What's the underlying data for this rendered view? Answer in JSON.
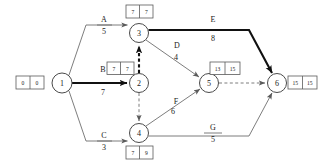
{
  "diagram": {
    "type": "project-network",
    "colors": {
      "background": "#ffffff",
      "edge": "#6e6e6e",
      "critical_path": "#111111",
      "node_stroke": "#4a4a4a",
      "box_stroke": "#5a5a5a",
      "text": "#1a1a1a"
    },
    "nodes": [
      {
        "id": "1",
        "label": "1",
        "cx": 62,
        "cy": 83,
        "r": 10
      },
      {
        "id": "2",
        "label": "2",
        "cx": 139,
        "cy": 83,
        "r": 9.5
      },
      {
        "id": "3",
        "label": "3",
        "cx": 139,
        "cy": 33,
        "r": 9.5
      },
      {
        "id": "4",
        "label": "4",
        "cx": 139,
        "cy": 133,
        "r": 9.5
      },
      {
        "id": "5",
        "label": "5",
        "cx": 209,
        "cy": 83,
        "r": 9.5
      },
      {
        "id": "6",
        "label": "6",
        "cx": 277,
        "cy": 83,
        "r": 9.5
      }
    ],
    "time_boxes": [
      {
        "node": "1",
        "early": "0",
        "late": "0",
        "x": 16,
        "y": 76,
        "position": "left"
      },
      {
        "node": "3",
        "early": "7",
        "late": "7",
        "x": 126,
        "y": 5,
        "position": "above"
      },
      {
        "node": "2",
        "early": "7",
        "late": "7",
        "x": 107,
        "y": 62,
        "position": "upper-left"
      },
      {
        "node": "4",
        "early": "7",
        "late": "9",
        "x": 126,
        "y": 146,
        "position": "below"
      },
      {
        "node": "5",
        "early": "13",
        "late": "15",
        "x": 210,
        "y": 62,
        "position": "above"
      },
      {
        "node": "6",
        "early": "15",
        "late": "15",
        "x": 288,
        "y": 76,
        "position": "right"
      }
    ],
    "edges": [
      {
        "id": "A",
        "name": "A",
        "duration": "5",
        "from": "1",
        "to": "3",
        "style": "solid",
        "critical": false,
        "label_x": 104,
        "label_y": 22
      },
      {
        "id": "B",
        "name": "B",
        "duration": "7",
        "from": "1",
        "to": "2",
        "style": "solid",
        "critical": true,
        "label_x": 103,
        "label_y": 72
      },
      {
        "id": "C",
        "name": "C",
        "duration": "3",
        "from": "1",
        "to": "4",
        "style": "solid",
        "critical": false,
        "label_x": 104,
        "label_y": 122
      },
      {
        "id": "D",
        "name": "D",
        "duration": "4",
        "from": "3",
        "to": "5",
        "style": "solid",
        "critical": false,
        "label_x": 177,
        "label_y": 49
      },
      {
        "id": "E",
        "name": "E",
        "duration": "8",
        "from": "3",
        "to": "6",
        "style": "solid",
        "critical": true,
        "label_x": 213,
        "label_y": 22
      },
      {
        "id": "F",
        "name": "F",
        "duration": "6",
        "from": "4",
        "to": "5",
        "style": "solid",
        "critical": false,
        "label_x": 176,
        "label_y": 104
      },
      {
        "id": "G",
        "name": "G",
        "duration": "5",
        "from": "4",
        "to": "6",
        "style": "solid",
        "critical": false,
        "label_x": 213,
        "label_y": 122
      }
    ],
    "dummy_edges": [
      {
        "id": "dummy-2-3",
        "from": "2",
        "to": "3",
        "style": "dashed",
        "critical": true
      },
      {
        "id": "dummy-2-4",
        "from": "2",
        "to": "4",
        "style": "dashed",
        "critical": false
      },
      {
        "id": "dummy-5-6",
        "from": "5",
        "to": "6",
        "style": "dashed",
        "critical": false
      }
    ]
  }
}
